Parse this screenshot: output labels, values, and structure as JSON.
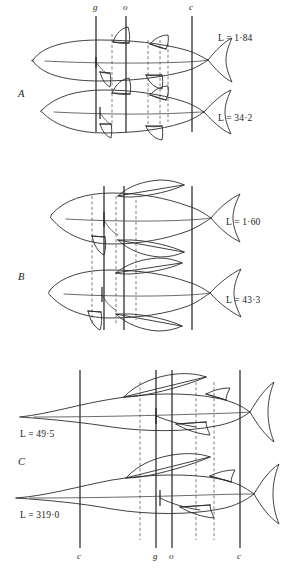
{
  "figure": {
    "kind": "line-diagram",
    "background_color": "#ffffff",
    "ink_color": "#1f1f1f",
    "dashed_color": "#5a5a5a"
  },
  "top_axis_labels": [
    {
      "text": "g",
      "x": 96
    },
    {
      "text": "o",
      "x": 126
    },
    {
      "text": "c",
      "x": 192
    }
  ],
  "bottom_axis_labels": [
    {
      "text": "c",
      "x": 80
    },
    {
      "text": "g",
      "x": 156
    },
    {
      "text": "o",
      "x": 172
    },
    {
      "text": "c",
      "x": 240
    }
  ],
  "panels": [
    {
      "id": "A",
      "label": "A",
      "label_x": 18,
      "label_y": 95,
      "specimens": [
        {
          "length_label": "L = 1·84",
          "value": 1.84,
          "label_x": 218,
          "label_y": 37
        },
        {
          "length_label": "L = 34·2",
          "value": 34.2,
          "label_x": 218,
          "label_y": 117
        }
      ]
    },
    {
      "id": "B",
      "label": "B",
      "label_x": 18,
      "label_y": 278,
      "specimens": [
        {
          "length_label": "L = 1·60",
          "value": 1.6,
          "label_x": 226,
          "label_y": 221
        },
        {
          "length_label": "L = 43·3",
          "value": 43.3,
          "label_x": 226,
          "label_y": 299
        }
      ]
    },
    {
      "id": "C",
      "label": "C",
      "label_x": 18,
      "label_y": 463,
      "specimens": [
        {
          "length_label": "L = 49·5",
          "value": 49.5,
          "label_x": 20,
          "label_y": 433
        },
        {
          "length_label": "L = 319·0",
          "value": 319.0,
          "label_x": 20,
          "label_y": 514
        }
      ]
    }
  ],
  "reference_lines": {
    "solid_upper": [
      96,
      126,
      192
    ],
    "solid_lower": [
      80,
      156,
      172,
      240
    ],
    "legend_meaning": {
      "g": "gill-line",
      "o": "origin-line",
      "c": "caudal-line"
    }
  }
}
